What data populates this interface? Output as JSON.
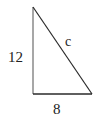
{
  "diagram": {
    "type": "right-triangle",
    "labels": {
      "vertical_leg": "12",
      "horizontal_leg": "8",
      "hypotenuse": "c"
    },
    "colors": {
      "stroke": "#2a2a2a",
      "vertical_leg_stroke": "#8a8a8a",
      "text": "#222222",
      "background": "#ffffff"
    }
  }
}
